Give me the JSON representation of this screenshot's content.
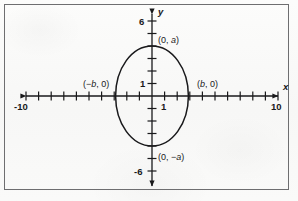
{
  "figure": {
    "type": "cartesian-plot"
  },
  "axes": {
    "x_label": "x",
    "y_label": "y",
    "x_min_tick_label": "-10",
    "x_max_tick_label": "10",
    "y_max_tick_label": "6",
    "y_min_tick_label": "-6",
    "x_unit_label": "1",
    "y_unit_label": "1"
  },
  "annotations": {
    "top_vertex": "(0, a)",
    "bottom_vertex": "(0, -a)",
    "left_vertex": "(-b, 0)",
    "right_vertex": "(b, 0)"
  },
  "colors": {
    "ink": "#19191b",
    "frame": "#6e6e70",
    "paper": "#fbfbfa"
  },
  "chart_data": {
    "type": "line",
    "title": "",
    "xlabel": "x",
    "ylabel": "y",
    "xlim": [
      -10,
      10
    ],
    "ylim": [
      -6,
      6
    ],
    "grid": false,
    "legend": null,
    "xticks": [
      -10,
      -9,
      -8,
      -7,
      -6,
      -5,
      -4,
      -3,
      -2,
      -1,
      1,
      2,
      3,
      4,
      5,
      6,
      7,
      8,
      9,
      10
    ],
    "xticklabels": [
      "-10",
      "",
      "",
      "",
      "",
      "",
      "",
      "",
      "",
      "",
      "1",
      "",
      "",
      "",
      "",
      "",
      "",
      "",
      "",
      "10"
    ],
    "yticks": [
      -6,
      -5,
      -4,
      -3,
      -2,
      -1,
      1,
      2,
      3,
      4,
      5,
      6
    ],
    "yticklabels": [
      "-6",
      "",
      "",
      "",
      "",
      "",
      "1",
      "",
      "",
      "",
      "",
      "6"
    ],
    "series": [
      {
        "name": "ellipse",
        "shape": "ellipse",
        "center": [
          0,
          0
        ],
        "semi_axis_x": 2.8,
        "semi_axis_y": 4.0,
        "equation": "x^2/b^2 + y^2/a^2 = 1"
      }
    ],
    "annotations": [
      {
        "text": "(0, a)",
        "x": 0,
        "y": 4.0,
        "anchor": "left-above"
      },
      {
        "text": "(0, -a)",
        "x": 0,
        "y": -4.0,
        "anchor": "left-below"
      },
      {
        "text": "(-b, 0)",
        "x": -2.8,
        "y": 0,
        "anchor": "left-above"
      },
      {
        "text": "(b, 0)",
        "x": 2.8,
        "y": 0,
        "anchor": "right-above"
      }
    ]
  }
}
